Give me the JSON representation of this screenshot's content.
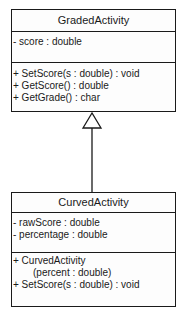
{
  "diagram": {
    "type": "UML class diagram",
    "relationship": "generalization",
    "classes": [
      {
        "name": "GradedActivity",
        "attributes": [
          "- score : double"
        ],
        "operations": [
          "+ SetScore(s : double) : void",
          "+ GetScore() : double",
          "+ GetGrade() : char"
        ]
      },
      {
        "name": "CurvedActivity",
        "attributes": [
          "- rawScore : double",
          "- percentage : double"
        ],
        "operations": [
          "+ CurvedActivity",
          "(percent : double)",
          "+ SetScore(s : double) : void"
        ]
      }
    ],
    "edges": [
      {
        "from": "CurvedActivity",
        "to": "GradedActivity",
        "arrow": "hollow-triangle"
      }
    ]
  }
}
